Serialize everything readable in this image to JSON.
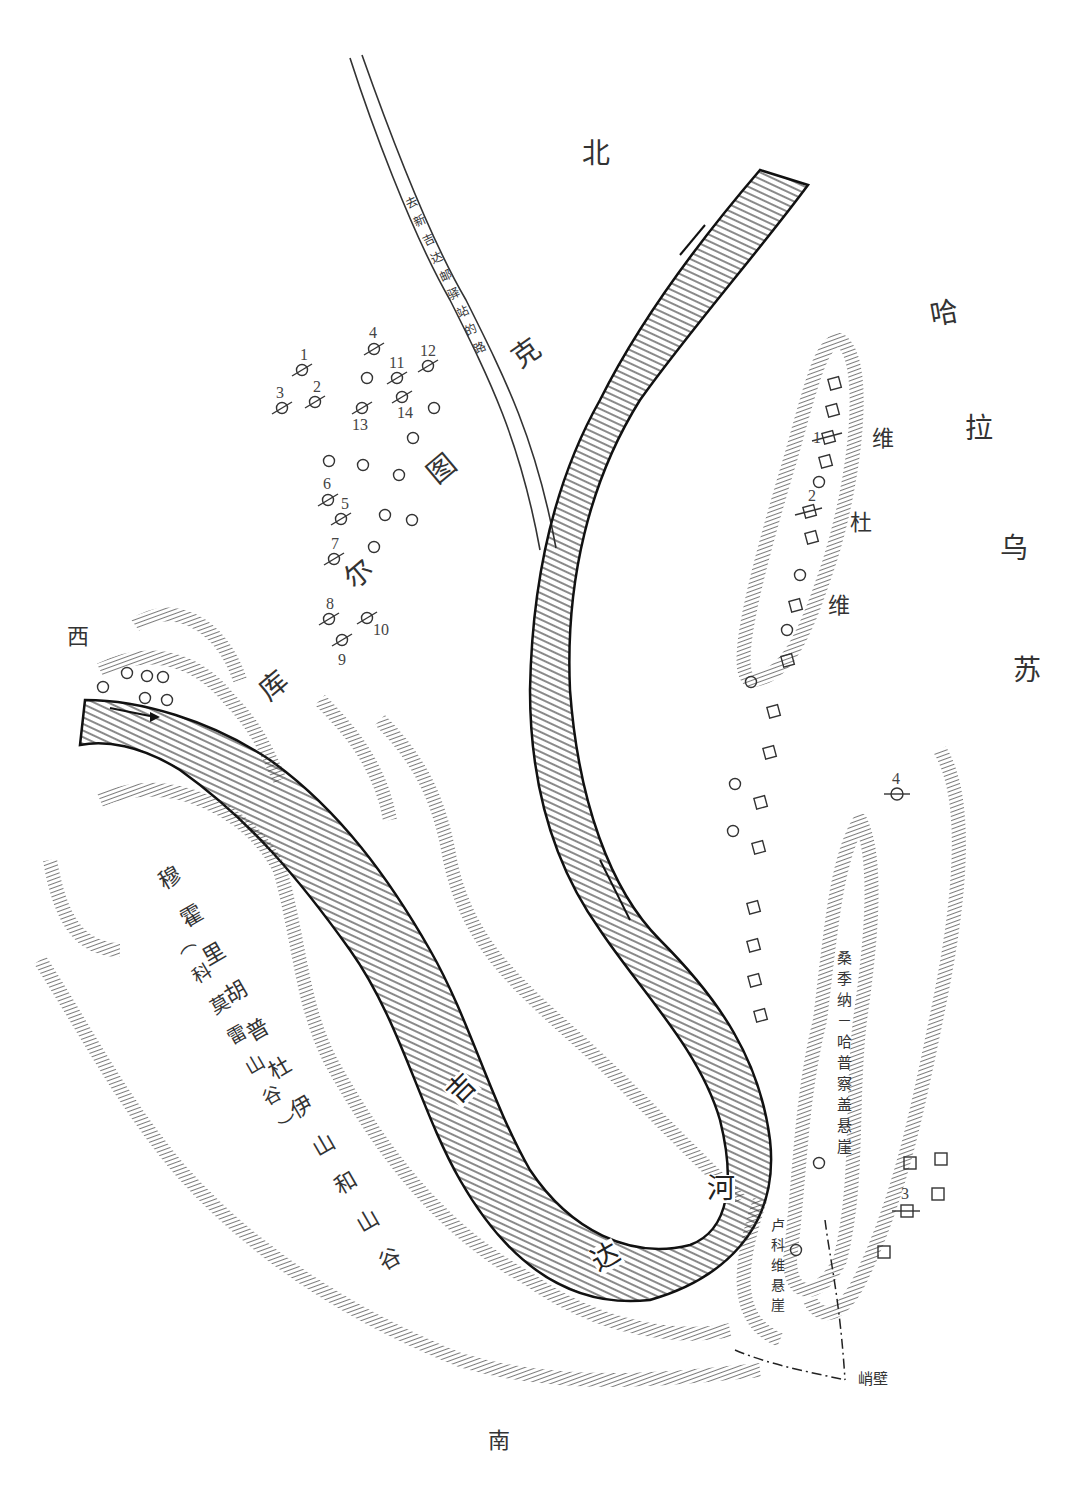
{
  "map": {
    "compass": {
      "north": "北",
      "south": "南",
      "west": "西"
    },
    "regions": {
      "kurtuk": [
        "克",
        "图",
        "尔",
        "库"
      ],
      "kurtuk_full": "库尔图克",
      "kharausu": [
        "哈",
        "拉",
        "乌",
        "苏"
      ],
      "kharausu_full": "哈拉乌苏",
      "viduvi": [
        "维",
        "杜",
        "维"
      ],
      "viduvi_full": "维杜维",
      "river": [
        "吉",
        "达",
        "河"
      ],
      "river_full": "吉达河",
      "mountains": "穆霍里胡普杜伊山和山谷",
      "mountains_alt": "（科莫雷山谷）",
      "sangina_cliff": "桑季纳－哈普察盖悬崖",
      "lukovi_cliff": "卢科维悬崖",
      "steep_wall": "峭壁",
      "road": "去新吉达邮驿站的路"
    },
    "markers": {
      "burial_numbered_west": [
        "1",
        "2",
        "3",
        "4",
        "5",
        "6",
        "7",
        "8",
        "9",
        "10",
        "11",
        "12",
        "13",
        "14"
      ],
      "viduvi_numbered": [
        "1",
        "2"
      ],
      "east_numbered": [
        "3",
        "4"
      ]
    },
    "legend_symbols": {
      "crossed_circle": "numbered-burial-icon",
      "circle": "circle-marker-icon",
      "square": "square-marker-icon",
      "crossed_square": "numbered-square-icon"
    },
    "colors": {
      "ink": "#1a1a1a",
      "paper": "#ffffff",
      "label": "#333333"
    }
  }
}
